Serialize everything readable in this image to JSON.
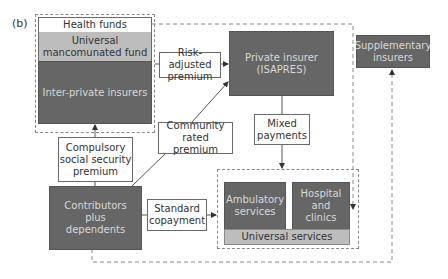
{
  "panel_label": "(b)",
  "nodes": {
    "health_funds": "Health funds",
    "universal_fund": "Universal mancomunated fund",
    "inter_private": "Inter-private insurers",
    "private_insurer": "Private insurer (ISAPRES)",
    "supplementary": "Supplementary insurers",
    "contributors": "Contributors plus dependents",
    "ambulatory": "Ambulatory services",
    "hospital": "Hospital and clinics",
    "universal_services": "Universal services"
  },
  "edge_labels": {
    "risk_adjusted": "Risk-adjusted premium",
    "community_rated": "Community rated premium",
    "compulsory": "Compulsory social security premium",
    "mixed_payments": "Mixed payments",
    "standard_copayment": "Standard copayment"
  },
  "colors": {
    "dark_fill": "#666666",
    "mid_fill": "#bdbdbd",
    "line": "#555555"
  }
}
